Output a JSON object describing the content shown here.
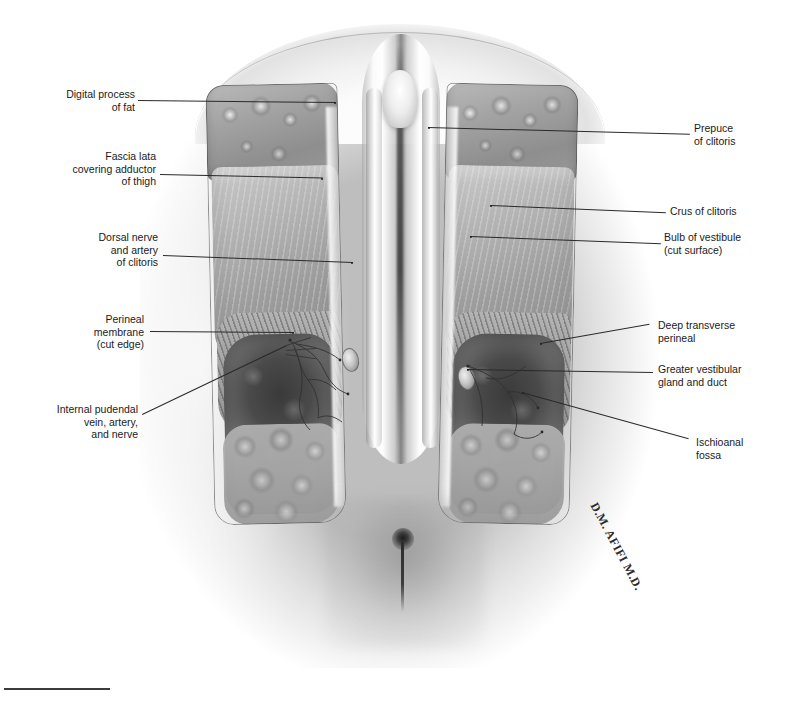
{
  "plate": {
    "title": "Female perineum, superficial dissection",
    "signature": "D.M. AFIFI M.D.",
    "background_color": "#ffffff",
    "ink_color": "#1a1a1a",
    "style": "grayscale pencil / carbon-dust anatomical illustration"
  },
  "labels_left": [
    {
      "id": "digital-process-of-fat",
      "text": "Digital process\nof fat"
    },
    {
      "id": "fascia-lata",
      "text": "Fascia lata\ncovering adductor\nof thigh"
    },
    {
      "id": "dorsal-nerve-artery",
      "text": "Dorsal nerve\nand artery\nof clitoris"
    },
    {
      "id": "perineal-membrane",
      "text": "Perineal\nmembrane\n(cut edge)"
    },
    {
      "id": "internal-pudendal",
      "text": "Internal pudendal\nvein, artery,\nand nerve"
    }
  ],
  "labels_right": [
    {
      "id": "prepuce-of-clitoris",
      "text": "Prepuce\nof clitoris"
    },
    {
      "id": "crus-of-clitoris",
      "text": "Crus of clitoris"
    },
    {
      "id": "bulb-of-vestibule",
      "text": "Bulb of vestibule\n(cut surface)"
    },
    {
      "id": "deep-transverse-perineal",
      "text": "Deep transverse\nperineal"
    },
    {
      "id": "greater-vestibular",
      "text": "Greater vestibular\ngland and duct"
    },
    {
      "id": "ischioanal-fossa",
      "text": "Ischioanal\nfossa"
    }
  ]
}
